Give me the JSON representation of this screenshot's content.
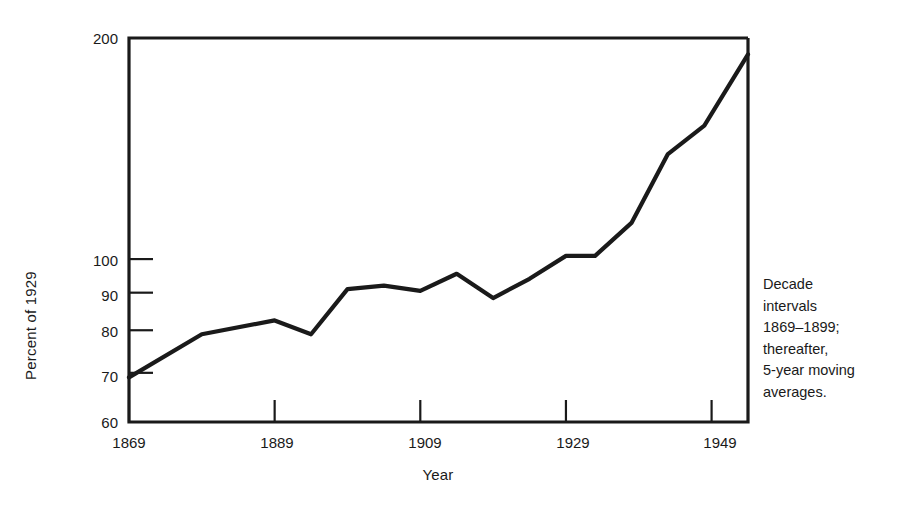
{
  "chart_data": {
    "type": "line",
    "title": "",
    "xlabel": "Year",
    "ylabel": "Percent of 1929",
    "xlim": [
      1869,
      1954
    ],
    "ylim": [
      60,
      200
    ],
    "yscale": "log",
    "grid": false,
    "legend": "none",
    "xticks": [
      1869,
      1889,
      1909,
      1929,
      1949
    ],
    "xticklabels": [
      "1869",
      "1889",
      "1909",
      "1929",
      "1949"
    ],
    "yticks": [
      60,
      70,
      80,
      90,
      100,
      200
    ],
    "yticklabels": [
      "60",
      "70",
      "80",
      "90",
      "100",
      "200"
    ],
    "annotation": "Decade\nintervals\n1869–1899;\nthereafter,\n5-year moving\naverages.",
    "series": [
      {
        "name": "Index of output per worker",
        "x": [
          1869,
          1879,
          1889,
          1894,
          1899,
          1904,
          1909,
          1914,
          1919,
          1924,
          1929,
          1933,
          1938,
          1943,
          1948,
          1954
        ],
        "values": [
          69,
          79,
          82.5,
          79,
          91,
          92,
          90.5,
          95.5,
          88.5,
          94,
          101,
          101,
          112,
          139,
          152,
          190
        ]
      }
    ]
  },
  "axes": {
    "y_axis_title": "Percent of 1929",
    "x_axis_title": "Year"
  },
  "note": {
    "text": "Decade\nintervals\n1869–1899;\nthereafter,\n5-year moving\naverages."
  },
  "style": {
    "line_color": "#1a1a1a",
    "axis_color": "#1a1a1a",
    "background": "#ffffff"
  }
}
